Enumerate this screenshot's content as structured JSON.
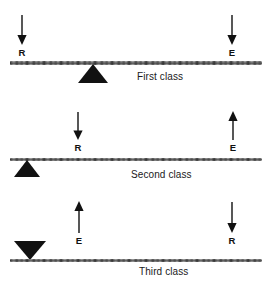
{
  "figure": {
    "title": "",
    "background_color": "#ffffff",
    "ink_color": "#111111",
    "levers": [
      {
        "id": "first-class",
        "caption": "First class",
        "fulcrum": {
          "direction": "up",
          "position": "center-left"
        },
        "forces": [
          {
            "symbol": "R",
            "name": "resistance",
            "direction": "down",
            "side": "left"
          },
          {
            "symbol": "E",
            "name": "effort",
            "direction": "down",
            "side": "right"
          }
        ]
      },
      {
        "id": "second-class",
        "caption": "Second class",
        "fulcrum": {
          "direction": "up",
          "position": "far-left"
        },
        "forces": [
          {
            "symbol": "R",
            "name": "resistance",
            "direction": "down",
            "side": "left-center"
          },
          {
            "symbol": "E",
            "name": "effort",
            "direction": "up",
            "side": "right"
          }
        ]
      },
      {
        "id": "third-class",
        "caption": "Third class",
        "fulcrum": {
          "direction": "down",
          "position": "far-left"
        },
        "forces": [
          {
            "symbol": "E",
            "name": "effort",
            "direction": "up",
            "side": "left-center"
          },
          {
            "symbol": "R",
            "name": "resistance",
            "direction": "down",
            "side": "right"
          }
        ]
      }
    ]
  }
}
